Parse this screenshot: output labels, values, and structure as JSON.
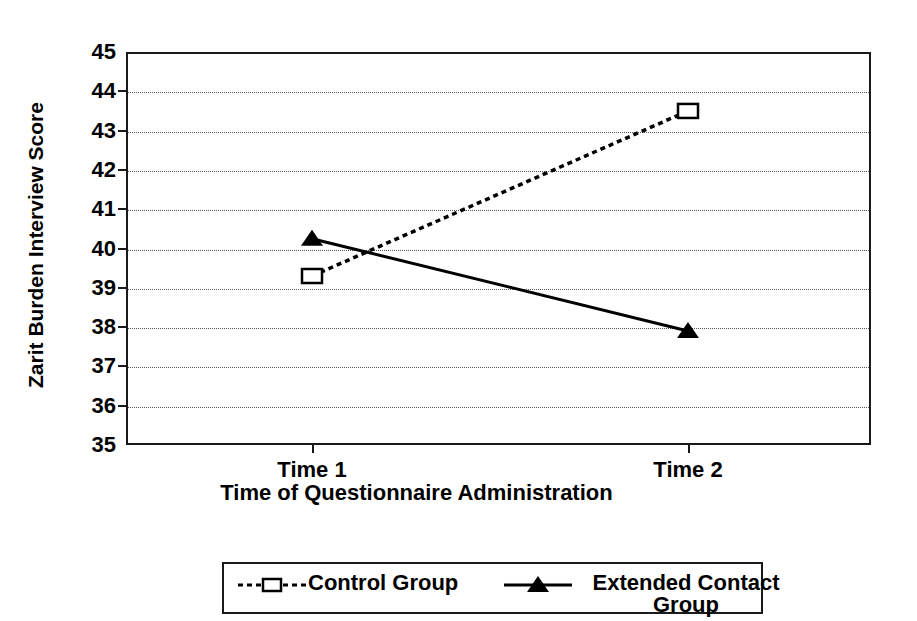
{
  "chart_data": {
    "type": "line",
    "title": "",
    "xlabel": "Time of Questionnaire Administration",
    "ylabel": "Zarit Burden Interview Score",
    "categories": [
      "Time 1",
      "Time 2"
    ],
    "ylim": [
      35,
      45
    ],
    "yticks": [
      "45",
      "44",
      "43",
      "42",
      "41",
      "40",
      "39",
      "38",
      "37",
      "36",
      "35"
    ],
    "grid": true,
    "legend_position": "bottom",
    "series": [
      {
        "name": "Control Group",
        "values": [
          39.3,
          43.5
        ],
        "marker": "open-square",
        "linestyle": "dotted",
        "color": "#000000"
      },
      {
        "name": "Extended Contact Group",
        "values": [
          40.25,
          37.9
        ],
        "marker": "filled-triangle",
        "linestyle": "solid",
        "color": "#000000"
      }
    ]
  },
  "axes": {
    "y_title": "Zarit Burden Interview Score",
    "x_title": "Time of Questionnaire Administration",
    "x_tick_labels": [
      "Time 1",
      "Time 2"
    ],
    "y_tick_labels": [
      "45",
      "44",
      "43",
      "42",
      "41",
      "40",
      "39",
      "38",
      "37",
      "36",
      "35"
    ]
  },
  "legend": {
    "items": [
      {
        "label": "Control Group",
        "line": "dotted",
        "marker": "open-square"
      },
      {
        "label": "Extended Contact Group",
        "line": "solid",
        "marker": "filled-triangle"
      }
    ]
  },
  "colors": {
    "axis": "#1a1a1a",
    "grid": "#555555",
    "series": "#000000",
    "background": "#ffffff"
  }
}
